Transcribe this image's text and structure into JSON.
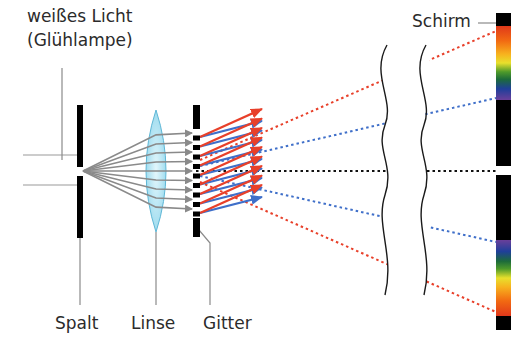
{
  "labels": {
    "light_source_line1": "weißes Licht",
    "light_source_line2": "(Glühlampe)",
    "screen": "Schirm",
    "slit": "Spalt",
    "lens": "Linse",
    "grating": "Gitter"
  },
  "colors": {
    "red_ray": "#e8402a",
    "blue_ray": "#3f6fc9",
    "gray_ray": "#8a8a8a",
    "black_component": "#000000",
    "lens_fill": "#bfe8f5",
    "lens_stroke": "#5fb7d6",
    "text": "#2b2b2b"
  },
  "geometry": {
    "slit_x": 80,
    "lens_x": 156,
    "grating_x": 196,
    "break_lines_x": [
      382,
      421
    ],
    "screen_x": 503,
    "center_y": 171,
    "beam_count": 9
  },
  "spectrum": {
    "upper": [
      "#e8401c",
      "#f06a12",
      "#f7a41a",
      "#f2e22a",
      "#4e9a2a",
      "#1c6b3a",
      "#1f3f9a",
      "#6a3f9a"
    ],
    "lower": [
      "#6a3f9a",
      "#1f3f9a",
      "#1c6b3a",
      "#4e9a2a",
      "#f2e22a",
      "#f7a41a",
      "#f06a12",
      "#e8401c"
    ]
  }
}
